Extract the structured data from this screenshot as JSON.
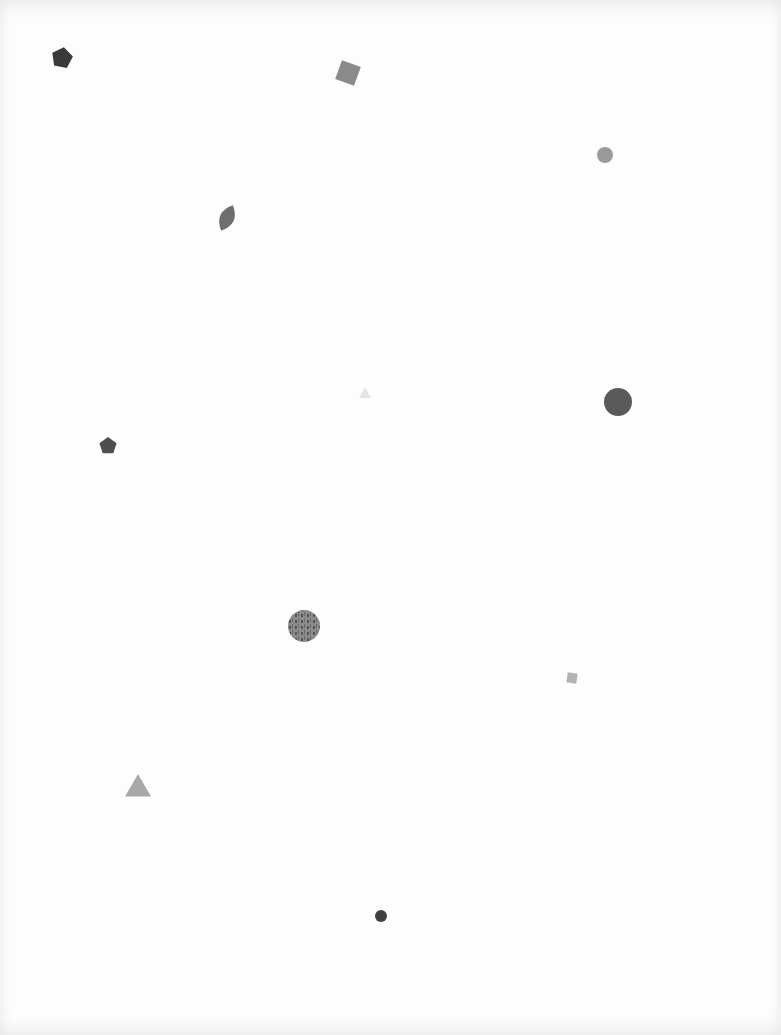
{
  "page": {
    "background": "#fdfdfd",
    "shape_count": 12
  },
  "shapes": [
    {
      "type": "pentagon",
      "fill": "#3a3a3a",
      "label": "dark pentagon"
    },
    {
      "type": "square",
      "fill": "#8a8a8a",
      "label": "rotated gray square"
    },
    {
      "type": "circle",
      "fill": "#9a9a9a",
      "label": "small textured circle"
    },
    {
      "type": "leaf",
      "fill": "#6e6e6e",
      "label": "leaf shape"
    },
    {
      "type": "triangle",
      "fill": "#e4e4e4",
      "label": "faint triangle"
    },
    {
      "type": "circle",
      "fill": "#5a5a5a",
      "label": "large dark circle"
    },
    {
      "type": "pentagon",
      "fill": "#4e4e4e",
      "label": "small pentagon"
    },
    {
      "type": "circle",
      "fill": "#8c8c8c",
      "label": "textured photo circle"
    },
    {
      "type": "square",
      "fill": "#b4b4b4",
      "label": "small light square"
    },
    {
      "type": "triangle",
      "fill": "#a8a8a8",
      "label": "gray triangle"
    },
    {
      "type": "circle",
      "fill": "#404040",
      "label": "small dark circle"
    }
  ]
}
